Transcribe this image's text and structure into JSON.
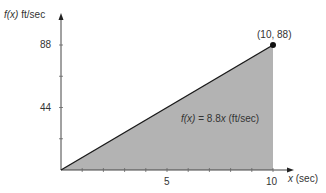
{
  "chart_data": {
    "type": "area",
    "title": "",
    "function_label": "f(x) = 8.8x (ft/sec)",
    "function_label_parts": {
      "fx": "f(x)",
      "eq": " = 8.8",
      "x": "x",
      "unit": " (ft/sec)"
    },
    "xlabel": "x (sec)",
    "xlabel_parts": {
      "var": "x",
      "unit": " (sec)"
    },
    "ylabel": "f(x) ft/sec",
    "ylabel_parts": {
      "var": "f(x)",
      "unit": " ft/sec"
    },
    "x": [
      0,
      10
    ],
    "y": [
      0,
      88
    ],
    "xlim": [
      0,
      11
    ],
    "ylim": [
      0,
      110
    ],
    "x_ticks": [
      1,
      2,
      3,
      4,
      5,
      6,
      7,
      8,
      9,
      10
    ],
    "x_tick_labels": {
      "5": "5",
      "10": "10"
    },
    "y_ticks": [
      22,
      44,
      66,
      88
    ],
    "y_tick_labels": {
      "44": "44",
      "88": "88"
    },
    "annotations": [
      {
        "text": "(10, 88)",
        "x": 10,
        "y": 88,
        "marker": "filled-circle"
      }
    ],
    "shaded_region": {
      "from_x": 0,
      "to_x": 10,
      "under": "f(x)",
      "color": "#b3b3b3"
    },
    "grid": false,
    "legend": null
  },
  "colors": {
    "fill": "#b3b3b3",
    "line": "#1a1a1a",
    "axis": "#444444",
    "text": "#333333"
  }
}
